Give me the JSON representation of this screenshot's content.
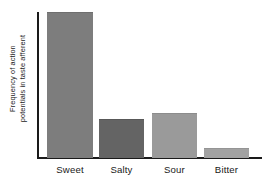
{
  "chart_data": {
    "type": "bar",
    "title": "",
    "subtitle": "",
    "xlabel": "",
    "ylabel_line1": "Frequency of action",
    "ylabel_line2": "potentials in taste afferent",
    "ylabel": "Frequency of action potentials in taste afferent",
    "categories": [
      "Sweet",
      "Salty",
      "Sour",
      "Bitter"
    ],
    "values": [
      100,
      26.7,
      30.8,
      6.8
    ],
    "value_unit": "relative frequency (%) of maximum",
    "ylim": [
      0,
      100
    ],
    "axis_ticks": [],
    "tick_labels": [],
    "grid": false,
    "legend": false,
    "legend_position": "none",
    "annotations": [],
    "bars": [
      {
        "category": "Sweet",
        "value": 100,
        "color": "#7d7d7d",
        "edge_color": "#6f6f6f"
      },
      {
        "category": "Salty",
        "value": 26.7,
        "color": "#646464",
        "edge_color": "#585858"
      },
      {
        "category": "Sour",
        "value": 30.8,
        "color": "#9a9a9a",
        "edge_color": "#8c8c8c"
      },
      {
        "category": "Bitter",
        "value": 6.8,
        "color": "#a2a2a2",
        "edge_color": "#949494"
      }
    ]
  },
  "style": {
    "background": "#ffffff",
    "axis_color": "#1a1a1a",
    "text_color": "#181818"
  }
}
